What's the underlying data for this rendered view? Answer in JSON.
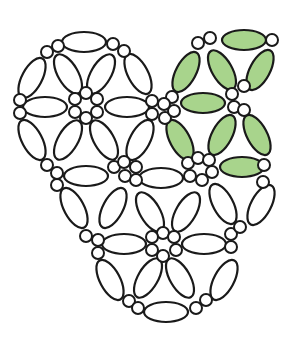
{
  "diagram": {
    "colors": {
      "outline": "#1a1a1a",
      "petal_default": "#ffffff",
      "petal_highlight": "#a8d48c",
      "bead": "#ffffff",
      "background": "#ffffff"
    },
    "petals": [
      {
        "cx": 84,
        "cy": 42,
        "rx": 22,
        "ry": 10,
        "rot": 0,
        "hl": false
      },
      {
        "cx": 32,
        "cy": 78,
        "rx": 22,
        "ry": 10,
        "rot": -62,
        "hl": false
      },
      {
        "cx": 68,
        "cy": 74,
        "rx": 22,
        "ry": 10,
        "rot": 60,
        "hl": false
      },
      {
        "cx": 101,
        "cy": 74,
        "rx": 22,
        "ry": 10,
        "rot": -60,
        "hl": false
      },
      {
        "cx": 138,
        "cy": 74,
        "rx": 22,
        "ry": 10,
        "rot": 62,
        "hl": false
      },
      {
        "cx": 45,
        "cy": 107,
        "rx": 22,
        "ry": 10,
        "rot": 0,
        "hl": false
      },
      {
        "cx": 127,
        "cy": 107,
        "rx": 22,
        "ry": 10,
        "rot": 0,
        "hl": false
      },
      {
        "cx": 32,
        "cy": 140,
        "rx": 22,
        "ry": 10,
        "rot": 62,
        "hl": false
      },
      {
        "cx": 68,
        "cy": 140,
        "rx": 22,
        "ry": 10,
        "rot": -60,
        "hl": false
      },
      {
        "cx": 104,
        "cy": 140,
        "rx": 22,
        "ry": 10,
        "rot": 60,
        "hl": false
      },
      {
        "cx": 140,
        "cy": 140,
        "rx": 22,
        "ry": 10,
        "rot": -62,
        "hl": false
      },
      {
        "cx": 86,
        "cy": 176,
        "rx": 22,
        "ry": 10,
        "rot": 0,
        "hl": false
      },
      {
        "cx": 161,
        "cy": 178,
        "rx": 22,
        "ry": 10,
        "rot": 0,
        "hl": false
      },
      {
        "cx": 74,
        "cy": 208,
        "rx": 22,
        "ry": 10,
        "rot": 62,
        "hl": false
      },
      {
        "cx": 113,
        "cy": 208,
        "rx": 22,
        "ry": 10,
        "rot": -62,
        "hl": false
      },
      {
        "cx": 150,
        "cy": 212,
        "rx": 22,
        "ry": 10,
        "rot": 60,
        "hl": false
      },
      {
        "cx": 186,
        "cy": 212,
        "rx": 22,
        "ry": 10,
        "rot": -60,
        "hl": false
      },
      {
        "cx": 223,
        "cy": 204,
        "rx": 22,
        "ry": 10,
        "rot": 62,
        "hl": false
      },
      {
        "cx": 261,
        "cy": 205,
        "rx": 22,
        "ry": 10,
        "rot": -62,
        "hl": false
      },
      {
        "cx": 124,
        "cy": 244,
        "rx": 22,
        "ry": 10,
        "rot": 0,
        "hl": false
      },
      {
        "cx": 204,
        "cy": 244,
        "rx": 22,
        "ry": 10,
        "rot": 0,
        "hl": false
      },
      {
        "cx": 110,
        "cy": 280,
        "rx": 22,
        "ry": 10,
        "rot": 62,
        "hl": false
      },
      {
        "cx": 148,
        "cy": 278,
        "rx": 22,
        "ry": 10,
        "rot": -60,
        "hl": false
      },
      {
        "cx": 180,
        "cy": 278,
        "rx": 22,
        "ry": 10,
        "rot": 60,
        "hl": false
      },
      {
        "cx": 224,
        "cy": 280,
        "rx": 22,
        "ry": 10,
        "rot": -62,
        "hl": false
      },
      {
        "cx": 166,
        "cy": 312,
        "rx": 22,
        "ry": 10,
        "rot": 0,
        "hl": false
      },
      {
        "cx": 244,
        "cy": 40,
        "rx": 22,
        "ry": 10,
        "rot": 0,
        "hl": true
      },
      {
        "cx": 186,
        "cy": 72,
        "rx": 22,
        "ry": 10,
        "rot": -62,
        "hl": true
      },
      {
        "cx": 222,
        "cy": 70,
        "rx": 22,
        "ry": 10,
        "rot": 60,
        "hl": true
      },
      {
        "cx": 260,
        "cy": 70,
        "rx": 22,
        "ry": 10,
        "rot": -62,
        "hl": true
      },
      {
        "cx": 203,
        "cy": 103,
        "rx": 22,
        "ry": 10,
        "rot": 0,
        "hl": true
      },
      {
        "cx": 180,
        "cy": 140,
        "rx": 22,
        "ry": 10,
        "rot": 62,
        "hl": true
      },
      {
        "cx": 222,
        "cy": 135,
        "rx": 22,
        "ry": 10,
        "rot": -62,
        "hl": true
      },
      {
        "cx": 257,
        "cy": 135,
        "rx": 22,
        "ry": 10,
        "rot": 62,
        "hl": true
      },
      {
        "cx": 242,
        "cy": 167,
        "rx": 22,
        "ry": 10,
        "rot": 0,
        "hl": true
      }
    ],
    "beads": [
      {
        "cx": 86,
        "cy": 93
      },
      {
        "cx": 97,
        "cy": 99
      },
      {
        "cx": 97,
        "cy": 112
      },
      {
        "cx": 86,
        "cy": 118
      },
      {
        "cx": 75,
        "cy": 112
      },
      {
        "cx": 75,
        "cy": 99
      },
      {
        "cx": 47,
        "cy": 52
      },
      {
        "cx": 58,
        "cy": 46
      },
      {
        "cx": 113,
        "cy": 44
      },
      {
        "cx": 124,
        "cy": 51
      },
      {
        "cx": 20,
        "cy": 100
      },
      {
        "cx": 20,
        "cy": 113
      },
      {
        "cx": 152,
        "cy": 101
      },
      {
        "cx": 152,
        "cy": 114
      },
      {
        "cx": 165,
        "cy": 118
      },
      {
        "cx": 47,
        "cy": 165
      },
      {
        "cx": 57,
        "cy": 173
      },
      {
        "cx": 114,
        "cy": 167
      },
      {
        "cx": 124,
        "cy": 162
      },
      {
        "cx": 136,
        "cy": 167
      },
      {
        "cx": 57,
        "cy": 185
      },
      {
        "cx": 125,
        "cy": 176
      },
      {
        "cx": 136,
        "cy": 180
      },
      {
        "cx": 188,
        "cy": 163
      },
      {
        "cx": 198,
        "cy": 158
      },
      {
        "cx": 209,
        "cy": 160
      },
      {
        "cx": 212,
        "cy": 172
      },
      {
        "cx": 202,
        "cy": 180
      },
      {
        "cx": 190,
        "cy": 176
      },
      {
        "cx": 264,
        "cy": 165
      },
      {
        "cx": 263,
        "cy": 182
      },
      {
        "cx": 86,
        "cy": 236
      },
      {
        "cx": 98,
        "cy": 240
      },
      {
        "cx": 98,
        "cy": 253
      },
      {
        "cx": 163,
        "cy": 233
      },
      {
        "cx": 174,
        "cy": 237
      },
      {
        "cx": 176,
        "cy": 250
      },
      {
        "cx": 163,
        "cy": 256
      },
      {
        "cx": 152,
        "cy": 250
      },
      {
        "cx": 152,
        "cy": 237
      },
      {
        "cx": 231,
        "cy": 234
      },
      {
        "cx": 231,
        "cy": 247
      },
      {
        "cx": 240,
        "cy": 227
      },
      {
        "cx": 129,
        "cy": 301
      },
      {
        "cx": 138,
        "cy": 308
      },
      {
        "cx": 196,
        "cy": 308
      },
      {
        "cx": 206,
        "cy": 300
      },
      {
        "cx": 198,
        "cy": 43
      },
      {
        "cx": 210,
        "cy": 38
      },
      {
        "cx": 272,
        "cy": 40
      },
      {
        "cx": 244,
        "cy": 86
      },
      {
        "cx": 232,
        "cy": 94
      },
      {
        "cx": 234,
        "cy": 107
      },
      {
        "cx": 244,
        "cy": 110
      },
      {
        "cx": 172,
        "cy": 97
      },
      {
        "cx": 174,
        "cy": 111
      },
      {
        "cx": 164,
        "cy": 104
      }
    ]
  }
}
